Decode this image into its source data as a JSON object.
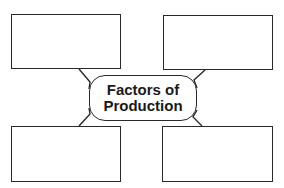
{
  "diagram": {
    "type": "concept-web",
    "center": {
      "lines": [
        "Factors of",
        "Production"
      ]
    },
    "boxes": [
      {
        "position": "top-left",
        "text": ""
      },
      {
        "position": "top-right",
        "text": ""
      },
      {
        "position": "bottom-left",
        "text": ""
      },
      {
        "position": "bottom-right",
        "text": ""
      }
    ],
    "colors": {
      "stroke": "#2a2a2a",
      "text": "#1a1a1a",
      "background": "#ffffff"
    }
  }
}
